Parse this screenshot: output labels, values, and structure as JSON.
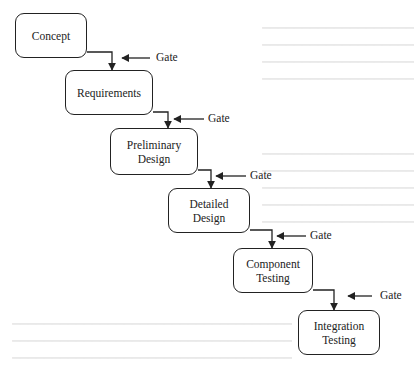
{
  "diagram": {
    "type": "waterfall-stage-gate",
    "colors": {
      "stroke": "#222222",
      "background": "#ffffff",
      "bleed_text": "#e9e9e9"
    },
    "stages": [
      {
        "id": "concept",
        "label": "Concept",
        "x": 15,
        "y": 13,
        "w": 72,
        "h": 45
      },
      {
        "id": "requirements",
        "label": "Requirements",
        "x": 65,
        "y": 70,
        "w": 88,
        "h": 45
      },
      {
        "id": "preliminary-design",
        "label": "Preliminary\nDesign",
        "x": 110,
        "y": 128,
        "w": 88,
        "h": 47
      },
      {
        "id": "detailed-design",
        "label": "Detailed\nDesign",
        "x": 168,
        "y": 188,
        "w": 82,
        "h": 45
      },
      {
        "id": "component-testing",
        "label": "Component\nTesting",
        "x": 233,
        "y": 248,
        "w": 80,
        "h": 45
      },
      {
        "id": "integration-testing",
        "label": "Integration\nTesting",
        "x": 298,
        "y": 310,
        "w": 82,
        "h": 45
      }
    ],
    "gates": [
      {
        "label": "Gate",
        "arrow_x1": 150,
        "arrow_x2": 122,
        "y": 58,
        "label_x": 156
      },
      {
        "label": "Gate",
        "arrow_x1": 204,
        "arrow_x2": 174,
        "y": 119,
        "label_x": 208
      },
      {
        "label": "Gate",
        "arrow_x1": 246,
        "arrow_x2": 216,
        "y": 176,
        "label_x": 250
      },
      {
        "label": "Gate",
        "arrow_x1": 306,
        "arrow_x2": 277,
        "y": 236,
        "label_x": 310
      },
      {
        "label": "Gate",
        "arrow_x1": 372,
        "arrow_x2": 348,
        "y": 296,
        "label_x": 380
      }
    ],
    "connectors": [
      {
        "from": "concept",
        "to": "requirements",
        "x_start": 87,
        "y": 52,
        "x_turn": 112,
        "y_end": 70
      },
      {
        "from": "requirements",
        "to": "preliminary-design",
        "x_start": 153,
        "y": 112,
        "x_turn": 168,
        "y_end": 128
      },
      {
        "from": "preliminary-design",
        "to": "detailed-design",
        "x_start": 198,
        "y": 170,
        "x_turn": 211,
        "y_end": 188
      },
      {
        "from": "detailed-design",
        "to": "component-testing",
        "x_start": 250,
        "y": 230,
        "x_turn": 272,
        "y_end": 248
      },
      {
        "from": "component-testing",
        "to": "integration-testing",
        "x_start": 313,
        "y": 290,
        "x_turn": 334,
        "y_end": 310
      }
    ]
  }
}
